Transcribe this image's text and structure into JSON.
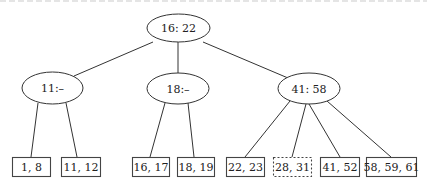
{
  "diagram": {
    "type": "B-tree (2-3 tree)",
    "root": {
      "label": "16: 22"
    },
    "internal_nodes": [
      {
        "id": "n11",
        "label": "11:–"
      },
      {
        "id": "n18",
        "label": "18:–"
      },
      {
        "id": "n41",
        "label": "41: 58"
      }
    ],
    "leaves": [
      {
        "id": "l1",
        "label": "1, 8",
        "parent": "n11",
        "style": "solid"
      },
      {
        "id": "l2",
        "label": "11, 12",
        "parent": "n11",
        "style": "solid"
      },
      {
        "id": "l3",
        "label": "16, 17",
        "parent": "n18",
        "style": "solid"
      },
      {
        "id": "l4",
        "label": "18, 19",
        "parent": "n18",
        "style": "solid"
      },
      {
        "id": "l5",
        "label": "22, 23",
        "parent": "n41",
        "style": "solid"
      },
      {
        "id": "l6",
        "label": "28, 31",
        "parent": "n41",
        "style": "dashed"
      },
      {
        "id": "l7",
        "label": "41, 52",
        "parent": "n41",
        "style": "solid"
      },
      {
        "id": "l8",
        "label": "58, 59, 61",
        "parent": "n41",
        "style": "solid"
      }
    ],
    "edges": [
      [
        "root",
        "n11"
      ],
      [
        "root",
        "n18"
      ],
      [
        "root",
        "n41"
      ],
      [
        "n11",
        "l1"
      ],
      [
        "n11",
        "l2"
      ],
      [
        "n18",
        "l3"
      ],
      [
        "n18",
        "l4"
      ],
      [
        "n41",
        "l5"
      ],
      [
        "n41",
        "l6"
      ],
      [
        "n41",
        "l7"
      ],
      [
        "n41",
        "l8"
      ]
    ]
  }
}
